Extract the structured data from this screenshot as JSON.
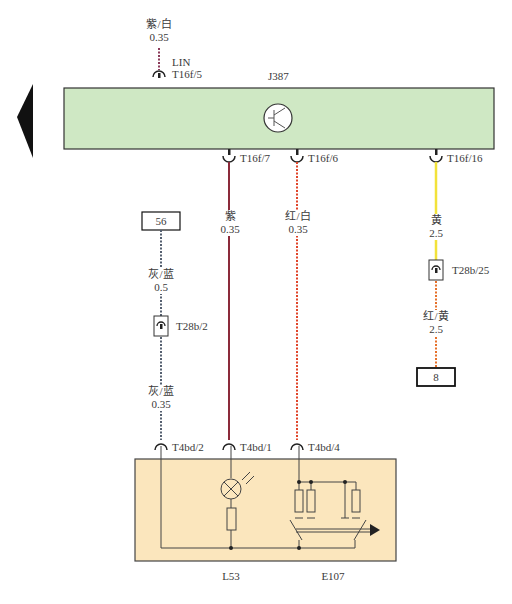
{
  "diagram": {
    "module": {
      "id": "J387",
      "color": "#cfe8c4"
    },
    "component_box": {
      "color": "#fbe6bd",
      "labels": [
        "L53",
        "E107"
      ]
    },
    "top_wire": {
      "color_label": "紫/白",
      "gauge": "0.35",
      "signal": "LIN",
      "pin": "T16f/5"
    },
    "module_pins": [
      {
        "pin": "T16f/7",
        "color_label": "紫",
        "gauge": "0.35",
        "wire_color": "#8b2a3a"
      },
      {
        "pin": "T16f/6",
        "color_label": "红/白",
        "gauge": "0.35",
        "wire_color": "#e0452a"
      },
      {
        "pin": "T16f/16",
        "color_label": "黄",
        "gauge": "2.5",
        "wire_color": "#f2e23a"
      }
    ],
    "left_wire": {
      "terminal": "56",
      "upper": {
        "color_label": "灰/蓝",
        "gauge": "0.5"
      },
      "connector": "T28b/2",
      "lower": {
        "color_label": "灰/蓝",
        "gauge": "0.35"
      }
    },
    "right_wire": {
      "connector": "T28b/25",
      "lower": {
        "color_label": "红/黄",
        "gauge": "2.5"
      },
      "terminal": "8"
    },
    "bottom_pins": [
      "T4bd/2",
      "T4bd/1",
      "T4bd/4"
    ]
  }
}
